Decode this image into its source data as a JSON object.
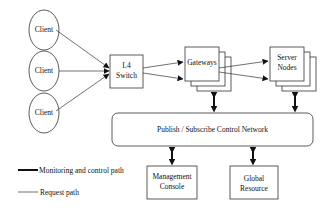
{
  "diagram": {
    "type": "architecture",
    "nodes": {
      "client_1": {
        "label": "Client",
        "shape": "ellipse"
      },
      "client_2": {
        "label": "Client",
        "shape": "ellipse"
      },
      "client_3": {
        "label": "Client",
        "shape": "ellipse"
      },
      "l4_switch": {
        "label_line1": "L4",
        "label_line2": "Switch",
        "shape": "box"
      },
      "gateways": {
        "label": "Gateways",
        "shape": "stacked-box"
      },
      "server_nodes": {
        "label_line1": "Server",
        "label_line2": "Nodes",
        "shape": "stacked-box"
      },
      "pubsub": {
        "label": "Publish / Subscribe Control Network",
        "shape": "rounded-box"
      },
      "management_console": {
        "label_line1": "Management",
        "label_line2": "Console",
        "shape": "box"
      },
      "global_resource": {
        "label_line1": "Global",
        "label_line2": "Resource",
        "shape": "box"
      }
    },
    "edges": [
      {
        "from": "client_1",
        "to": "l4_switch",
        "type": "request"
      },
      {
        "from": "client_2",
        "to": "l4_switch",
        "type": "request"
      },
      {
        "from": "client_3",
        "to": "l4_switch",
        "type": "request"
      },
      {
        "from": "l4_switch",
        "to": "gateways",
        "type": "request",
        "count": 2
      },
      {
        "from": "gateways",
        "to": "server_nodes",
        "type": "request",
        "count": 2
      },
      {
        "from": "gateways",
        "to": "pubsub",
        "type": "monitoring",
        "bidirectional": true
      },
      {
        "from": "server_nodes",
        "to": "pubsub",
        "type": "monitoring",
        "bidirectional": true
      },
      {
        "from": "pubsub",
        "to": "management_console",
        "type": "monitoring",
        "bidirectional": true
      },
      {
        "from": "pubsub",
        "to": "global_resource",
        "type": "monitoring",
        "bidirectional": true
      }
    ],
    "legend": {
      "monitoring": "Monitoring and control path",
      "request": "Request path"
    }
  }
}
